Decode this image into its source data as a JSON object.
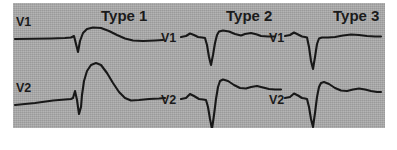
{
  "figure": {
    "background_color": "#a9a9a9",
    "trace_color": "#181818",
    "panel": {
      "left": 13,
      "top": 3,
      "width": 372,
      "height": 125
    }
  },
  "columns": [
    {
      "title": "Type 1",
      "title_x": 88,
      "leads": [
        {
          "label": "V1",
          "label_x": 3,
          "label_y": 12,
          "row": "top",
          "path": "M 2 36 L 38 35.5 L 52 35 L 58 34.5 L 61 33 L 63 41 L 65 49 L 67 38 L 70 30 L 74 26 L 80 24.5 L 88 25 L 96 28 L 104 32 L 112 35.5 L 120 37.5 L 130 38 L 142 37.5 L 150 37"
        },
        {
          "label": "V2",
          "label_x": 3,
          "label_y": 78,
          "row": "bottom",
          "path": "M 2 102 L 22 100 L 40 97.5 L 52 96.5 L 58 96 L 60 95 L 62 88 L 64 97 L 66 111 L 68 104 L 69 92 L 71 78 L 74 68 L 78 62 L 83 60 L 88 62 L 94 70 L 100 80 L 106 89 L 112 95 L 118 97.5 L 126 97 L 136 96 L 146 95.5 L 152 95"
        }
      ]
    },
    {
      "title": "Type 2",
      "title_x": 213,
      "leads": [
        {
          "label": "V1",
          "label_x": 148,
          "label_y": 28,
          "row": "top",
          "path": "M 168 34 L 173 33 L 177 30.5 L 181 32 L 185 34 L 189 34.5 L 192 35 L 194 42 L 196 54 L 198 62 L 200 52 L 202 40 L 204 32 L 206 28.5 L 210 27.5 L 216 28.5 L 222 31 L 228 32.5 L 232 31 L 238 30 L 244 31.5 L 248 33 L 255 33.5 L 262 33.5"
        },
        {
          "label": "V2",
          "label_x": 148,
          "label_y": 90,
          "row": "bottom",
          "path": "M 168 96 L 173 95 L 177 91 L 181 93 L 186 96 L 190 96.5 L 193 97 L 195 104 L 197 116 L 199 126 L 201 112 L 203 96 L 205 84 L 207 78 L 210 76.5 L 215 78 L 221 82 L 227 85 L 233 85.5 L 238 84 L 244 83 L 250 84.5 L 256 86 L 262 86.5 L 268 86.5"
        }
      ]
    },
    {
      "title": "Type 3",
      "title_x": 320,
      "leads": [
        {
          "label": "V1",
          "label_x": 256,
          "label_y": 28,
          "row": "top",
          "path": "M 272 33 L 277 32 L 281 29.5 L 285 31.5 L 289 33.5 L 292 34 L 294 34.5 L 296 44 L 298 58 L 300 66 L 302 54 L 304 41 L 306 35.5 L 309 34.5 L 315 34.5 L 322 34 L 330 32.5 L 338 31.5 L 346 32 L 354 33 L 362 33.5 L 368 33.5"
        },
        {
          "label": "V2",
          "label_x": 256,
          "label_y": 90,
          "row": "bottom",
          "path": "M 272 95 L 277 94 L 281 90.5 L 285 92.5 L 289 95 L 292 95.5 L 294 96 L 296 104 L 298 116 L 300 124 L 302 110 L 304 94 L 306 84 L 308 80 L 311 79 L 316 81 L 322 85 L 328 87.5 L 334 88 L 340 86.5 L 346 85.5 L 352 86.5 L 358 88 L 364 89 L 368 89"
        }
      ]
    }
  ]
}
